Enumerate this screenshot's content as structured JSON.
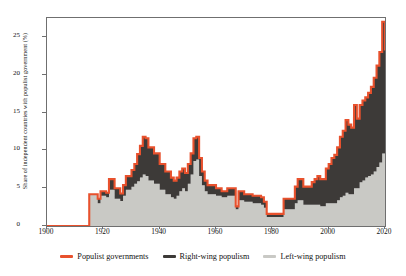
{
  "chart_data": {
    "type": "area",
    "title": "",
    "xlabel": "",
    "ylabel": "Share of independent countries with populist government (%)",
    "xlim": [
      1900,
      2020
    ],
    "ylim": [
      0,
      27.5
    ],
    "grid": false,
    "legend_position": "bottom",
    "xticks": [
      1900,
      1920,
      1940,
      1960,
      1980,
      2000,
      2020
    ],
    "yticks": [
      0,
      5,
      10,
      15,
      20,
      25
    ],
    "colors": {
      "populist_line": "#e8512d",
      "right_wing_fill": "#3d3a38",
      "left_wing_fill": "#c9c9c5",
      "axis": "#6f6f6f",
      "text": "#111111",
      "background": "#ffffff"
    },
    "series": [
      {
        "name": "Populist governments",
        "role": "total-outline",
        "color": "#e8512d",
        "values": [
          0,
          0,
          0,
          0,
          0,
          0,
          0,
          0,
          0,
          0,
          0,
          0,
          0,
          0,
          0,
          4.2,
          4.2,
          4.2,
          3.6,
          4.6,
          4.6,
          4.4,
          6.2,
          6.2,
          5.0,
          5.0,
          4.3,
          5.4,
          6.6,
          6.6,
          7.4,
          8.2,
          9.5,
          10.6,
          11.8,
          11.6,
          10.4,
          10.4,
          9.6,
          9.6,
          8.2,
          8.2,
          7.2,
          7.2,
          6.4,
          6.0,
          6.4,
          7.2,
          7.6,
          7.0,
          8.2,
          9.6,
          11.6,
          11.8,
          9.0,
          7.2,
          6.0,
          5.4,
          5.4,
          5.4,
          5.0,
          5.0,
          4.6,
          4.6,
          5.0,
          5.0,
          5.0,
          2.6,
          4.6,
          4.6,
          4.2,
          4.2,
          4.2,
          4.0,
          4.0,
          4.0,
          3.8,
          3.2,
          1.6,
          1.6,
          1.6,
          1.6,
          1.6,
          1.6,
          3.6,
          3.6,
          3.6,
          3.6,
          5.2,
          6.2,
          6.2,
          5.2,
          5.2,
          5.2,
          5.8,
          6.2,
          6.6,
          6.2,
          6.2,
          7.6,
          8.2,
          9.0,
          9.4,
          10.4,
          11.8,
          12.6,
          14.0,
          13.4,
          13.0,
          16.0,
          14.2,
          16.0,
          16.6,
          17.0,
          17.6,
          18.4,
          19.6,
          21.2,
          23.0,
          27.0,
          23.2
        ]
      },
      {
        "name": "Right-wing populism",
        "role": "upper-band",
        "color": "#3d3a38",
        "values": [
          0,
          0,
          0,
          0,
          0,
          0,
          0,
          0,
          0,
          0,
          0,
          0,
          0,
          0,
          0,
          0,
          0,
          0,
          0.6,
          0.6,
          0.6,
          0.6,
          1.4,
          1.4,
          1.4,
          1.4,
          1.0,
          1.4,
          1.8,
          1.8,
          2.2,
          2.6,
          3.6,
          4.2,
          5.0,
          5.0,
          4.4,
          4.4,
          4.0,
          4.0,
          3.4,
          3.4,
          3.0,
          3.0,
          2.6,
          2.4,
          2.4,
          2.6,
          2.6,
          2.4,
          2.6,
          2.8,
          3.0,
          3.0,
          2.4,
          1.8,
          1.4,
          1.2,
          1.2,
          1.2,
          1.0,
          1.0,
          0.8,
          0.8,
          1.0,
          1.0,
          1.0,
          0.4,
          1.2,
          1.2,
          1.0,
          1.0,
          1.0,
          1.0,
          1.0,
          1.0,
          1.0,
          0.8,
          0.4,
          0.4,
          0.4,
          0.4,
          0.4,
          0.4,
          1.4,
          1.4,
          1.4,
          1.4,
          2.2,
          2.8,
          2.8,
          2.4,
          2.4,
          2.4,
          3.0,
          3.4,
          3.8,
          3.6,
          3.6,
          4.6,
          5.2,
          6.0,
          6.4,
          7.0,
          8.0,
          8.6,
          9.6,
          9.2,
          8.8,
          11.0,
          9.2,
          10.2,
          10.6,
          10.6,
          11.0,
          11.6,
          12.4,
          13.4,
          14.6,
          17.4,
          15.0
        ]
      },
      {
        "name": "Left-wing populism",
        "role": "lower-band",
        "color": "#c9c9c5",
        "values": [
          0,
          0,
          0,
          0,
          0,
          0,
          0,
          0,
          0,
          0,
          0,
          0,
          0,
          0,
          0,
          4.2,
          4.2,
          4.2,
          3.0,
          4.0,
          4.0,
          3.8,
          4.8,
          4.8,
          3.6,
          3.6,
          3.3,
          4.0,
          4.8,
          4.8,
          5.2,
          5.6,
          5.9,
          6.4,
          6.8,
          6.6,
          6.0,
          6.0,
          5.6,
          5.6,
          4.8,
          4.8,
          4.2,
          4.2,
          3.8,
          3.6,
          4.0,
          4.6,
          5.0,
          4.6,
          5.6,
          6.8,
          8.6,
          8.8,
          6.6,
          5.4,
          4.6,
          4.2,
          4.2,
          4.2,
          4.0,
          4.0,
          3.8,
          3.8,
          4.0,
          4.0,
          4.0,
          2.2,
          3.4,
          3.4,
          3.2,
          3.2,
          3.2,
          3.0,
          3.0,
          3.0,
          2.8,
          2.4,
          1.2,
          1.2,
          1.2,
          1.2,
          1.2,
          1.2,
          2.2,
          2.2,
          2.2,
          2.2,
          3.0,
          3.4,
          3.4,
          2.8,
          2.8,
          2.8,
          2.8,
          2.8,
          2.8,
          2.6,
          2.6,
          3.0,
          3.0,
          3.0,
          3.0,
          3.4,
          3.8,
          4.0,
          4.4,
          4.2,
          4.2,
          5.0,
          5.0,
          5.8,
          6.0,
          6.4,
          6.6,
          6.8,
          7.2,
          7.8,
          8.4,
          9.6,
          8.2
        ]
      }
    ]
  },
  "axis": {
    "y_title": "Share of independent countries with populist government (%)",
    "y_tick_labels": [
      "0",
      "5",
      "10",
      "15",
      "20",
      "25"
    ],
    "x_tick_labels": [
      "1900",
      "1920",
      "1940",
      "1960",
      "1980",
      "2000",
      "2020"
    ]
  },
  "legend": {
    "items": [
      {
        "label": "Populist governments",
        "color": "#e8512d"
      },
      {
        "label": "Right-wing populism",
        "color": "#3d3a38"
      },
      {
        "label": "Left-wing populism",
        "color": "#c9c9c5"
      }
    ]
  }
}
